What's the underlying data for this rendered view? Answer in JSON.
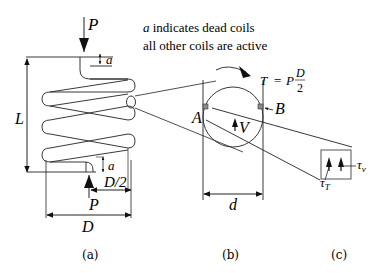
{
  "diagram": {
    "note": {
      "line1_symbol": "a",
      "line1_text": " indicates dead coils",
      "line2": "all other coils are active"
    },
    "panel_a": {
      "caption": "(a)",
      "load_top": "P",
      "load_bottom": "P",
      "length_label": "L",
      "dead_coil_top": "a",
      "dead_coil_bottom": "a",
      "half_diameter": "D/2",
      "diameter": "D"
    },
    "panel_b": {
      "caption": "(b)",
      "torque_lhs": "T",
      "torque_eq": "=",
      "torque_p": "P",
      "torque_num": "D",
      "torque_den": "2",
      "point_a": "A",
      "point_b": "B",
      "shear_force": "V",
      "wire_diameter": "d"
    },
    "panel_c": {
      "caption": "(c)",
      "tau_t": "τ",
      "tau_t_sub": "T",
      "tau_v": "τ",
      "tau_v_sub": "v"
    },
    "colors": {
      "line": "#222222",
      "marker_fill": "#8a8a8a",
      "background": "#ffffff"
    }
  }
}
